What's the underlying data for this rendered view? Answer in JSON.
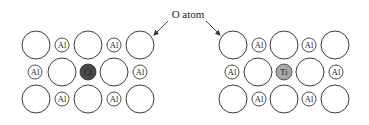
{
  "diagram": {
    "label": "O atom",
    "colors": {
      "cr_fill": "#4a4a4a",
      "ti_fill": "#a8a8a8",
      "outline": "#3a3a3a"
    },
    "panels": [
      {
        "name": "chromium-doped-alumina",
        "dopant": "Cr",
        "rows": [
          [
            "O",
            "Al",
            "O",
            "Al",
            "O"
          ],
          [
            "Al",
            "O",
            "Cr",
            "O",
            "Al"
          ],
          [
            "O",
            "Al",
            "O",
            "Al",
            "O"
          ]
        ]
      },
      {
        "name": "titanium-doped-alumina",
        "dopant": "Ti",
        "rows": [
          [
            "O",
            "Al",
            "O",
            "Al",
            "O"
          ],
          [
            "Al",
            "O",
            "Ti",
            "O",
            "Al"
          ],
          [
            "O",
            "Al",
            "O",
            "Al",
            "O"
          ]
        ]
      }
    ],
    "al_label": "Al"
  }
}
